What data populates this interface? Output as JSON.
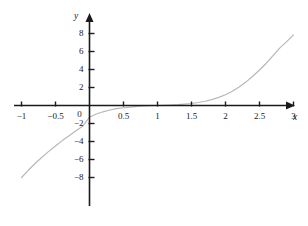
{
  "figure": {
    "background": "#ffffff",
    "axis_color": "#1a1a1a",
    "curve_color": "#b8b8b8",
    "origin_px": {
      "x": 89,
      "y": 105
    },
    "x_scale_px_per_unit": 68,
    "y_scale_px_per_unit": 9
  },
  "chart_data": {
    "type": "line",
    "title": "",
    "xlabel": "x",
    "ylabel": "y",
    "xlim": [
      -1.1,
      3.1
    ],
    "ylim": [
      -9.5,
      9.5
    ],
    "grid": false,
    "legend": null,
    "x_ticks": [
      -1,
      -0.5,
      0,
      0.5,
      1,
      1.5,
      2,
      2.5,
      3
    ],
    "x_tick_labels": [
      "-1",
      "-0.5",
      "0",
      "0.5",
      "1",
      "1.5",
      "2",
      "2.5",
      "3"
    ],
    "y_ticks": [
      -8,
      -6,
      -4,
      -2,
      2,
      4,
      6,
      8
    ],
    "y_tick_labels": [
      "-8",
      "-6",
      "-4",
      "-2",
      "2",
      "4",
      "6",
      "8"
    ],
    "series": [
      {
        "name": "curve",
        "color": "#b8b8b8",
        "x": [
          -1.0,
          -0.9,
          -0.8,
          -0.7,
          -0.6,
          -0.5,
          -0.4,
          -0.3,
          -0.2,
          -0.1,
          0.0,
          0.1,
          0.2,
          0.3,
          0.4,
          0.5,
          0.6,
          0.7,
          0.8,
          0.9,
          1.0,
          1.1,
          1.2,
          1.3,
          1.4,
          1.5,
          1.6,
          1.7,
          1.8,
          1.9,
          2.0,
          2.1,
          2.2,
          2.3,
          2.4,
          2.5,
          2.6,
          2.7,
          2.8,
          2.9,
          3.0
        ],
        "y": [
          -8.0,
          -7.2,
          -6.45,
          -5.75,
          -5.1,
          -4.5,
          -3.9,
          -3.35,
          -2.8,
          -2.3,
          -1.3,
          -0.95,
          -0.7,
          -0.5,
          -0.35,
          -0.25,
          -0.17,
          -0.1,
          -0.05,
          -0.02,
          0.0,
          0.02,
          0.05,
          0.09,
          0.15,
          0.22,
          0.33,
          0.47,
          0.66,
          0.9,
          1.2,
          1.58,
          2.05,
          2.6,
          3.25,
          3.95,
          4.7,
          5.55,
          6.4,
          7.1,
          7.85
        ]
      }
    ]
  },
  "labels": {
    "x_axis": "x",
    "y_axis": "y"
  }
}
